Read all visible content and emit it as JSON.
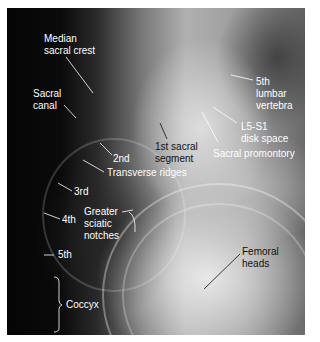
{
  "image": {
    "description": "Lateral radiograph of sacrum and coccyx with anatomical labels",
    "labels": {
      "median_sacral_crest": [
        "Median",
        "sacral crest"
      ],
      "sacral_canal": [
        "Sacral",
        "canal"
      ],
      "fifth_lumbar_vertebra": [
        "5th",
        "lumbar",
        "vertebra"
      ],
      "l5_s1_disk_space": [
        "L5-S1",
        "disk space"
      ],
      "first_sacral_segment": [
        "1st sacral",
        "segment"
      ],
      "sacral_promontory": "Sacral promontory",
      "second": "2nd",
      "transverse_ridges": "Transverse ridges",
      "third": "3rd",
      "fourth": "4th",
      "greater_sciatic_notches": [
        "Greater",
        "sciatic",
        "notches"
      ],
      "fifth": "5th",
      "femoral_heads": [
        "Femoral",
        "heads"
      ],
      "coccyx": "Coccyx"
    },
    "colors": {
      "label_light": "#ffffff",
      "label_dark": "#111111"
    }
  }
}
